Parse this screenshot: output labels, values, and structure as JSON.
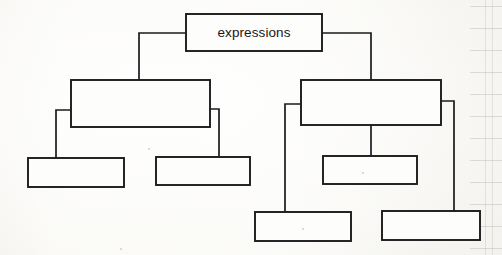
{
  "diagram": {
    "title": "expressions",
    "kind": "hierarchy-tree",
    "medium": "hand-drawn on ruled notebook paper",
    "stroke_color": "#1b1b1e",
    "paper_color": "#fbfbf9",
    "rule_color": "#9aa09a",
    "levels": 4,
    "node_count": 8,
    "labeled_node_count": 1,
    "blank_node_count": 7,
    "nodes": [
      {
        "id": "root",
        "label": "expressions",
        "level": 0,
        "x": 186,
        "y": 14,
        "w": 136,
        "h": 37,
        "empty": false
      },
      {
        "id": "left-branch",
        "label": "",
        "level": 1,
        "x": 71,
        "y": 80,
        "w": 139,
        "h": 47,
        "empty": true
      },
      {
        "id": "right-branch",
        "label": "",
        "level": 1,
        "x": 301,
        "y": 80,
        "w": 140,
        "h": 45,
        "empty": true
      },
      {
        "id": "left-child-1",
        "label": "",
        "level": 2,
        "x": 28,
        "y": 158,
        "w": 96,
        "h": 29,
        "empty": true
      },
      {
        "id": "left-child-2",
        "label": "",
        "level": 2,
        "x": 156,
        "y": 157,
        "w": 94,
        "h": 28,
        "empty": true
      },
      {
        "id": "right-child-center",
        "label": "",
        "level": 2,
        "x": 323,
        "y": 156,
        "w": 94,
        "h": 28,
        "empty": true
      },
      {
        "id": "right-child-left",
        "label": "",
        "level": 3,
        "x": 255,
        "y": 212,
        "w": 96,
        "h": 29,
        "empty": true
      },
      {
        "id": "right-child-right",
        "label": "",
        "level": 3,
        "x": 382,
        "y": 211,
        "w": 98,
        "h": 29,
        "empty": true
      }
    ],
    "edges": [
      {
        "id": "edge-root-left",
        "from": "root",
        "to": "left-branch",
        "style": "elbow-left"
      },
      {
        "id": "edge-root-right",
        "from": "root",
        "to": "right-branch",
        "style": "elbow-right"
      },
      {
        "id": "edge-left-child-1",
        "from": "left-branch",
        "to": "left-child-1",
        "style": "elbow-left"
      },
      {
        "id": "edge-left-child-2",
        "from": "left-branch",
        "to": "left-child-2",
        "style": "elbow-right"
      },
      {
        "id": "edge-right-center",
        "from": "right-branch",
        "to": "right-child-center",
        "style": "straight-down"
      },
      {
        "id": "edge-right-child-left",
        "from": "right-branch",
        "to": "right-child-left",
        "style": "elbow-left"
      },
      {
        "id": "edge-right-child-right",
        "from": "right-branch",
        "to": "right-child-right",
        "style": "elbow-right"
      }
    ],
    "ruled_lines": {
      "vertical_margin_x": [
        485,
        492
      ],
      "horizontal_y": [
        6,
        28,
        50,
        72,
        94,
        116,
        138,
        160,
        182,
        204,
        226,
        248
      ]
    }
  }
}
